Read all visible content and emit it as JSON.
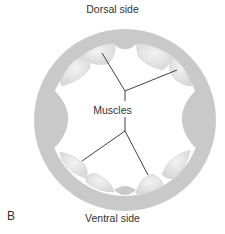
{
  "figure": {
    "panel_letter": "B",
    "labels": {
      "top": "Dorsal side",
      "bottom": "Ventral side",
      "center": "Muscles"
    },
    "colors": {
      "ring": "#c8c8c8",
      "muscle_fill": "#e2e2e2",
      "muscle_highlight": "#efefef",
      "leader_line": "#2b2b2b",
      "text": "#333333"
    }
  }
}
